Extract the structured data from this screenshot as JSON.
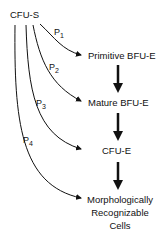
{
  "diagram": {
    "source_node": "CFU-S",
    "stages": [
      {
        "label": "Primitive BFU-E"
      },
      {
        "label": "Mature BFU-E"
      },
      {
        "label": "CFU-E"
      },
      {
        "label_lines": [
          "Morphologically",
          "Recognizable",
          "Cells"
        ]
      }
    ],
    "paths": [
      {
        "letter": "P",
        "subscript": "1"
      },
      {
        "letter": "P",
        "subscript": "2"
      },
      {
        "letter": "P",
        "subscript": "3"
      },
      {
        "letter": "P",
        "subscript": "4"
      }
    ],
    "colors": {
      "stroke": "#111111",
      "background": "#ffffff"
    }
  }
}
